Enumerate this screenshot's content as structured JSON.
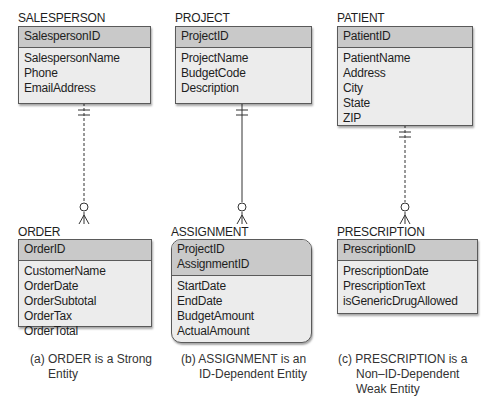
{
  "entities": {
    "salesperson": {
      "name": "SALESPERSON",
      "keys": [
        "SalespersonID"
      ],
      "attributes": [
        "SalespersonName",
        "Phone",
        "EmailAddress"
      ]
    },
    "project": {
      "name": "PROJECT",
      "keys": [
        "ProjectID"
      ],
      "attributes": [
        "ProjectName",
        "BudgetCode",
        "Description"
      ]
    },
    "patient": {
      "name": "PATIENT",
      "keys": [
        "PatientID"
      ],
      "attributes": [
        "PatientName",
        "Address",
        "City",
        "State",
        "ZIP"
      ]
    },
    "order": {
      "name": "ORDER",
      "keys": [
        "OrderID"
      ],
      "attributes": [
        "CustomerName",
        "OrderDate",
        "OrderSubtotal",
        "OrderTax",
        "OrderTotal"
      ]
    },
    "assignment": {
      "name": "ASSIGNMENT",
      "keys": [
        "ProjectID",
        "AssignmentID"
      ],
      "attributes": [
        "StartDate",
        "EndDate",
        "BudgetAmount",
        "ActualAmount"
      ]
    },
    "prescription": {
      "name": "PRESCRIPTION",
      "keys": [
        "PrescriptionID"
      ],
      "attributes": [
        "PrescriptionDate",
        "PrescriptionText",
        "isGenericDrugAllowed"
      ]
    }
  },
  "relationships": [
    {
      "from": "SALESPERSON",
      "to": "ORDER",
      "line": "dashed",
      "parent_cardinality": "exactly-one",
      "child_cardinality": "zero-or-many"
    },
    {
      "from": "PROJECT",
      "to": "ASSIGNMENT",
      "line": "solid",
      "parent_cardinality": "exactly-one",
      "child_cardinality": "zero-or-many"
    },
    {
      "from": "PATIENT",
      "to": "PRESCRIPTION",
      "line": "dashed",
      "parent_cardinality": "exactly-one",
      "child_cardinality": "zero-or-many"
    }
  ],
  "captions": {
    "a": {
      "line1": "(a) ORDER is a Strong",
      "line2": "Entity"
    },
    "b": {
      "line1": "(b) ASSIGNMENT is an",
      "line2": "ID-Dependent Entity"
    },
    "c": {
      "line1": "(c) PRESCRIPTION is a",
      "line2": "Non–ID-Dependent",
      "line3": "Weak Entity"
    }
  },
  "colors": {
    "key_fill": "#c9c9c9",
    "body_fill": "#ececec",
    "border": "#5a5a5a",
    "line": "#333333"
  }
}
